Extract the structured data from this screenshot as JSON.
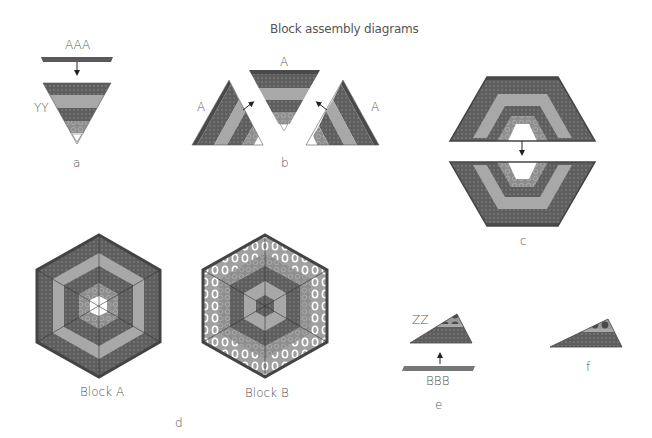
{
  "title": "Block assembly diagrams",
  "panels": {
    "a": {
      "caption": "a",
      "strip_label": "AAA",
      "seam_label": "YY"
    },
    "b": {
      "caption": "b",
      "top_label": "A",
      "left_label": "A",
      "right_label": "A"
    },
    "c": {
      "caption": "c"
    },
    "d": {
      "caption": "d",
      "block_a_label": "Block A",
      "block_b_label": "Block B"
    },
    "e": {
      "caption": "e",
      "strip_label": "BBB",
      "seam_label": "ZZ"
    },
    "f": {
      "caption": "f"
    }
  },
  "colors": {
    "dark": "#4e4e4e",
    "dark_dotted": "#6a6a6a",
    "medium": "#9a9a9a",
    "light": "#b8b8b8",
    "print": "#8c8c8c",
    "white": "#ffffff",
    "text": "#555555"
  }
}
